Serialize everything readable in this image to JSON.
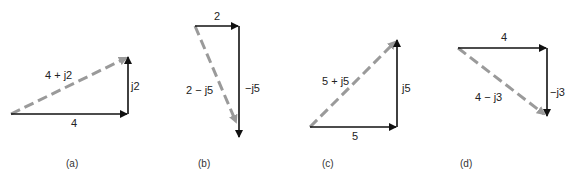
{
  "figure": {
    "panels": [
      {
        "id": "a",
        "caption": "(a)",
        "real": 4,
        "imag": 2,
        "real_label": "4",
        "imag_label": "j2",
        "sum_label": "4 + j2"
      },
      {
        "id": "b",
        "caption": "(b)",
        "real": 2,
        "imag": -5,
        "real_label": "2",
        "imag_label": "−j5",
        "sum_label": "2 − j5"
      },
      {
        "id": "c",
        "caption": "(c)",
        "real": 5,
        "imag": 5,
        "real_label": "5",
        "imag_label": "j5",
        "sum_label": "5 + j5"
      },
      {
        "id": "d",
        "caption": "(d)",
        "real": 4,
        "imag": -3,
        "real_label": "4",
        "imag_label": "−j3",
        "sum_label": "4 − j3"
      }
    ],
    "colors": {
      "component_arrow": "#111111",
      "resultant_arrow": "#9a9a9a",
      "text": "#222222"
    }
  }
}
